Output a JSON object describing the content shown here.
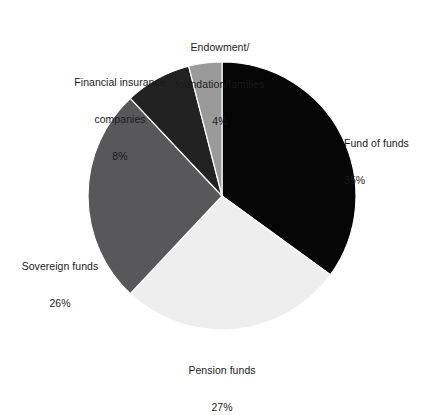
{
  "chart_data": {
    "type": "pie",
    "title": "",
    "xlabel": "",
    "ylabel": "",
    "legend_position": "none",
    "grid": false,
    "units": "percent",
    "total": 100,
    "start_angle_deg": 0,
    "direction": "clockwise",
    "categories": [
      "Fund of funds",
      "Pension funds",
      "Sovereign funds",
      "Financial insurance companies",
      "Endowment/foundation/families"
    ],
    "values": [
      35,
      27,
      26,
      8,
      4
    ],
    "slices": [
      {
        "label": "Fund of funds",
        "label_line1": "Fund of funds",
        "value": 35,
        "percent_text": "35%",
        "color": "#050505"
      },
      {
        "label": "Pension funds",
        "label_line1": "Pension funds",
        "value": 27,
        "percent_text": "27%",
        "color": "#eeeeee"
      },
      {
        "label": "Sovereign funds",
        "label_line1": "Sovereign funds",
        "value": 26,
        "percent_text": "26%",
        "color": "#58585a"
      },
      {
        "label": "Financial insurance companies",
        "label_line1": "Financial insurance",
        "label_line2": "companies",
        "value": 8,
        "percent_text": "8%",
        "color": "#222222"
      },
      {
        "label": "Endowment/foundation/families",
        "label_line1": "Endowment/",
        "label_line2": "foundation/families",
        "value": 4,
        "percent_text": "4%",
        "color": "#9a9a9a"
      }
    ],
    "geometry": {
      "center_x": 222,
      "center_y": 196,
      "radius": 134
    },
    "style": {
      "background": "#ffffff",
      "separator_color": "#ffffff",
      "label_color": "#1a1a1a"
    }
  }
}
